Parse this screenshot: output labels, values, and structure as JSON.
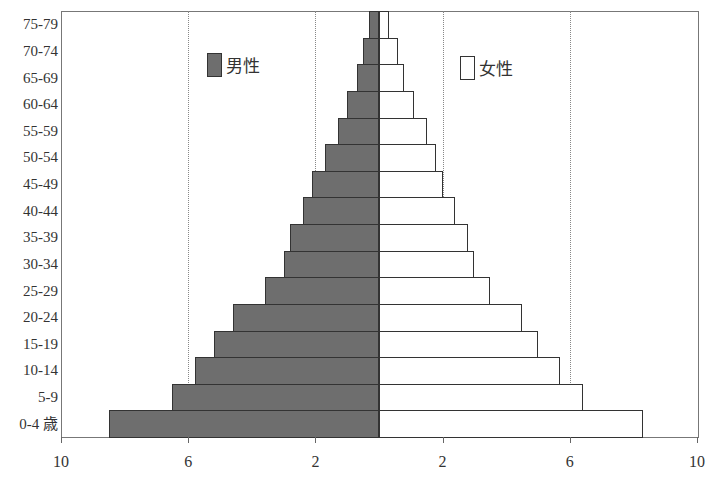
{
  "chart_data": {
    "type": "bar",
    "subtype": "population-pyramid",
    "title": "",
    "xlabel": "",
    "ylabel": "",
    "categories": [
      "75-79",
      "70-74",
      "65-69",
      "60-64",
      "55-59",
      "50-54",
      "45-49",
      "40-44",
      "35-39",
      "30-34",
      "25-29",
      "20-24",
      "15-19",
      "10-14",
      "5-9",
      "0-4 歳"
    ],
    "series": [
      {
        "name": "男性",
        "side": "left",
        "color": "#6e6e6e",
        "values": [
          0.3,
          0.5,
          0.7,
          1.0,
          1.3,
          1.7,
          2.1,
          2.4,
          2.8,
          3.0,
          3.6,
          4.6,
          5.2,
          5.8,
          6.5,
          8.5
        ]
      },
      {
        "name": "女性",
        "side": "right",
        "color": "#ffffff",
        "values": [
          0.3,
          0.6,
          0.8,
          1.1,
          1.5,
          1.8,
          2.0,
          2.4,
          2.8,
          3.0,
          3.5,
          4.5,
          5.0,
          5.7,
          6.4,
          8.3
        ]
      }
    ],
    "xlim": [
      -10,
      10
    ],
    "x_tick_values": [
      -10,
      -6,
      -2,
      2,
      6,
      10
    ],
    "x_tick_labels": [
      "10",
      "6",
      "2",
      "2",
      "6",
      "10"
    ],
    "gridlines": [
      -6,
      -2,
      2,
      6
    ],
    "grid": "vertical dotted",
    "legend": {
      "position": "inside-top",
      "entries": [
        "男性",
        "女性"
      ]
    }
  },
  "legend": {
    "male_label": "男性",
    "female_label": "女性"
  }
}
